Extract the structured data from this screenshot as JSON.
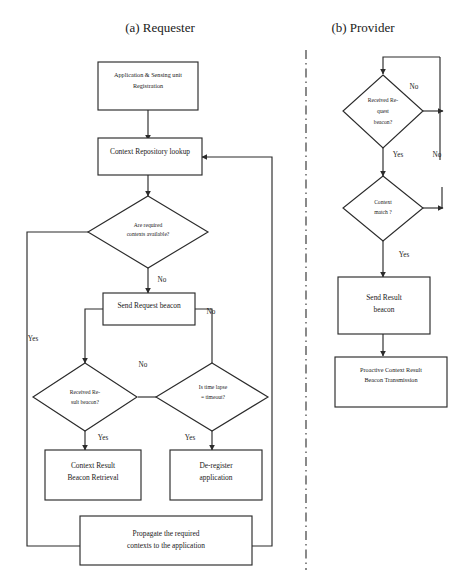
{
  "figure": {
    "background": "#ffffff",
    "ink_color": "#2b2b2b",
    "text_color": "#1a1a1a"
  },
  "panels": [
    {
      "id": "requester",
      "title": "(a) Requester"
    },
    {
      "id": "provider",
      "title": "(b) Provider"
    }
  ],
  "requester": {
    "nodes": {
      "registration": {
        "type": "process",
        "line1": "Application & Sensing unit",
        "line2": "Registration"
      },
      "repo_lookup": {
        "type": "process",
        "line1": "Context Repository lookup",
        "line2": ""
      },
      "contexts_avail": {
        "type": "decision",
        "line1": "Are required",
        "line2": "contexts available?",
        "line3": ""
      },
      "send_request": {
        "type": "process",
        "line1": "Send Request beacon",
        "line2": ""
      },
      "recv_result": {
        "type": "decision",
        "line1": "Received  Re-",
        "line2": "sult beacon?",
        "line3": ""
      },
      "time_lapse": {
        "type": "decision",
        "line1": "Is  time  lapse",
        "line2": "= timeout?",
        "line3": ""
      },
      "ctx_retrieval": {
        "type": "process",
        "line1": "Context Result",
        "line2": "Beacon Retrieval"
      },
      "deregister": {
        "type": "process",
        "line1": "De-register",
        "line2": "application"
      },
      "propagate": {
        "type": "process",
        "line1": "Propagate the required",
        "line2": "contexts to the application"
      }
    },
    "edge_labels": {
      "avail_yes": "Yes",
      "avail_no": "No",
      "send_to_timeout": "No",
      "recv_no": "No",
      "recv_yes": "Yes",
      "timeout_yes": "Yes"
    }
  },
  "provider": {
    "nodes": {
      "recv_request": {
        "type": "decision",
        "line1": "Received Re-",
        "line2": "quest",
        "line3": "beacon?"
      },
      "ctx_match": {
        "type": "decision",
        "line1": "Context",
        "line2": "match ?",
        "line3": ""
      },
      "send_result": {
        "type": "process",
        "line1": "Send Result",
        "line2": "beacon"
      },
      "proactive": {
        "type": "process",
        "line1": "Proactive Context Result",
        "line2": "Beacon Transmission"
      }
    },
    "edge_labels": {
      "recv_no": "No",
      "recv_yes": "Yes",
      "match_no": "No",
      "match_yes": "Yes"
    }
  }
}
